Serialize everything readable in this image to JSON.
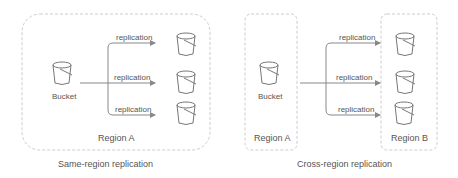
{
  "colors": {
    "stroke": "#888888",
    "border": "#cccccc",
    "text": "#555555"
  },
  "same_region": {
    "caption": "Same-region replication",
    "region_label": "Region A",
    "source_label": "Bucket",
    "arrows": [
      {
        "label": "replication"
      },
      {
        "label": "replication"
      },
      {
        "label": "replication"
      }
    ]
  },
  "cross_region": {
    "caption": "Cross-region replication",
    "source_region_label": "Region A",
    "target_region_label": "Region B",
    "source_label": "Bucket",
    "arrows": [
      {
        "label": "replication"
      },
      {
        "label": "replication"
      },
      {
        "label": "replication"
      }
    ]
  }
}
